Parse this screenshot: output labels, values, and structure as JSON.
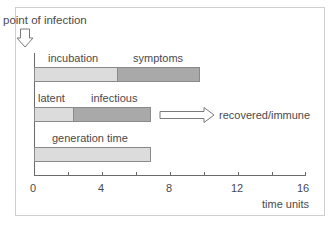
{
  "diagram": {
    "title": "point of infection",
    "rows": [
      {
        "id": "disease-course",
        "segments": [
          {
            "label": "incubation",
            "start": 0,
            "end": 4.9,
            "shade": "light"
          },
          {
            "label": "symptoms",
            "start": 4.9,
            "end": 9.7,
            "shade": "dark"
          }
        ]
      },
      {
        "id": "infection-course",
        "segments": [
          {
            "label": "latent",
            "start": 0,
            "end": 2.3,
            "shade": "light"
          },
          {
            "label": "infectious",
            "start": 2.3,
            "end": 6.8,
            "shade": "dark"
          }
        ],
        "outcome": "recovered/immune"
      },
      {
        "id": "generation",
        "segments": [
          {
            "label": "generation time",
            "start": 0,
            "end": 6.8,
            "shade": "light"
          }
        ]
      }
    ],
    "x_axis": {
      "label": "time units",
      "ticks": [
        "0",
        "4",
        "8",
        "12",
        "16"
      ],
      "range": [
        0,
        16
      ],
      "minor_step": 2
    },
    "colors": {
      "light_segment": "#dcdcdc",
      "dark_segment": "#a9a9a9",
      "border": "#8a8a8a",
      "text": "#4a4a4a",
      "frame": "#cfcfcf"
    }
  }
}
